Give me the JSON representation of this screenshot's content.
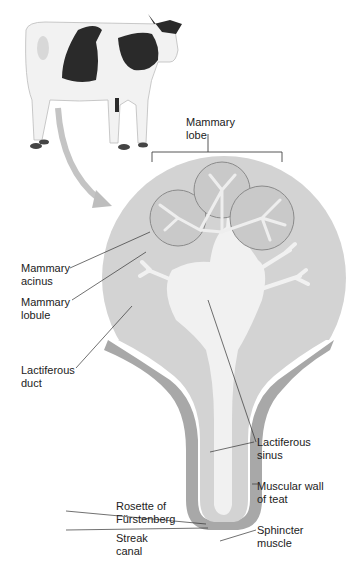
{
  "diagram": {
    "labels": {
      "mammary_lobe": "Mammary\nlobe",
      "mammary_acinus": "Mammary\nacinus",
      "mammary_lobule": "Mammary\nlobule",
      "lactiferous_duct": "Lactiferous\nduct",
      "lactiferous_sinus": "Lactiferous\nsinus",
      "muscular_wall": "Muscular wall\nof teat",
      "rosette": "Rosette of\nFürstenberg",
      "streak_canal": "Streak\ncanal",
      "sphincter": "Sphincter\nmuscle"
    },
    "colors": {
      "gland_tissue": "#d3d3d3",
      "sinus": "#f1f1f1",
      "wall": "#a8a8a8",
      "lobe_outline": "#8a8a8a",
      "cow_spots": "#2a2a2a",
      "cow_body": "#f2f2f2"
    }
  }
}
